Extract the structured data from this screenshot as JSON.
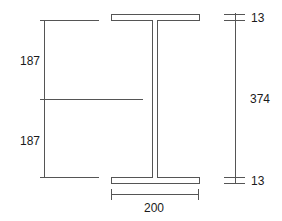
{
  "diagram": {
    "type": "I-beam cross-section dimension drawing",
    "colors": {
      "line": "#555555",
      "text": "#1a1a1a",
      "background": "#ffffff"
    },
    "dimensions": {
      "upper_half_height": "187",
      "lower_half_height": "187",
      "total_height": "374",
      "top_flange_thickness": "13",
      "bottom_flange_thickness": "13",
      "flange_width": "200"
    }
  }
}
